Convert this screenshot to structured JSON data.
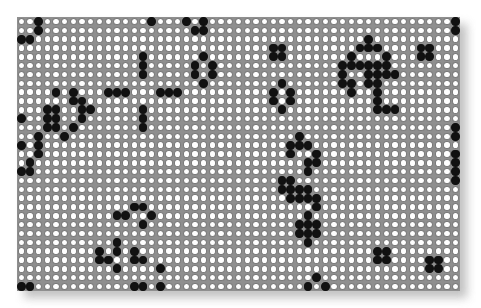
{
  "game": {
    "name": "Conway's Game of Life",
    "columns": 51,
    "rows": 31,
    "colors": {
      "alive": "#111111",
      "dead": "#ffffff",
      "grid": "#8f8f8f"
    },
    "alive_cells_by_row": {
      "0": [
        2,
        15,
        19,
        21,
        50
      ],
      "1": [
        2,
        20,
        21,
        50
      ],
      "2": [
        0,
        1,
        40
      ],
      "3": [
        29,
        30,
        39,
        40,
        41,
        46,
        47
      ],
      "4": [
        14,
        21,
        29,
        30,
        38,
        42,
        46,
        47
      ],
      "5": [
        14,
        20,
        22,
        37,
        38,
        39,
        40,
        41,
        42
      ],
      "6": [
        14,
        20,
        22,
        37,
        40,
        41,
        42,
        43
      ],
      "7": [
        21,
        30,
        37,
        38,
        40,
        41
      ],
      "8": [
        4,
        6,
        10,
        11,
        12,
        16,
        17,
        18,
        29,
        31,
        38,
        41
      ],
      "9": [
        6,
        7,
        29,
        31,
        41
      ],
      "10": [
        3,
        4,
        7,
        8,
        14,
        30,
        41,
        42,
        43
      ],
      "11": [
        0,
        3,
        4,
        7,
        14
      ],
      "12": [
        3,
        4,
        6,
        14,
        50
      ],
      "13": [
        2,
        5,
        32,
        50
      ],
      "14": [
        0,
        2,
        31,
        32,
        33
      ],
      "15": [
        2,
        31,
        34,
        50
      ],
      "16": [
        1,
        33,
        34,
        50
      ],
      "17": [
        0,
        1,
        33,
        50
      ],
      "18": [
        30,
        31,
        50
      ],
      "19": [
        30,
        31,
        32,
        33
      ],
      "20": [
        31,
        32,
        33,
        34
      ],
      "21": [
        13,
        14,
        34
      ],
      "22": [
        11,
        12,
        15,
        33
      ],
      "23": [
        14,
        32,
        33,
        34
      ],
      "24": [
        32,
        33,
        34
      ],
      "25": [
        11,
        33
      ],
      "26": [
        9,
        11,
        13,
        41,
        42
      ],
      "27": [
        9,
        10,
        13,
        14,
        41,
        42,
        47,
        48
      ],
      "28": [
        11,
        16,
        47,
        48
      ],
      "29": [
        34
      ],
      "30": [
        0,
        1,
        13,
        14,
        16,
        33,
        35
      ]
    }
  }
}
